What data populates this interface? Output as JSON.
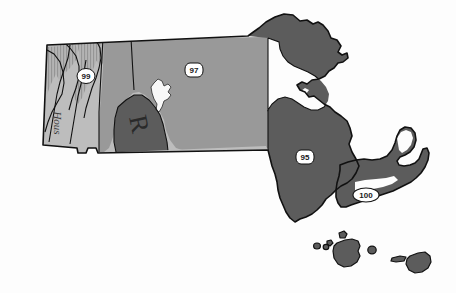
{
  "map": {
    "title": "Massachusetts zone map",
    "subject": "Massachusetts",
    "background_color": "#fdfdfd",
    "outline_color": "#000000",
    "colors": {
      "light_zone": "#bdbdbd",
      "mid_zone": "#999999",
      "dark_zone": "#5c5c5c",
      "hatch_zone": "#b0b0b0",
      "water_white": "#f7f7f7",
      "outline": "#111111",
      "label_badge_fill": "#ffffff",
      "label_text": "#1a1a1a"
    },
    "zone_labels": [
      {
        "id": "zone-99",
        "value": "99",
        "shape": "oval",
        "cx": 86,
        "cy": 76,
        "rx": 9,
        "ry": 7
      },
      {
        "id": "zone-97",
        "value": "97",
        "shape": "rounded",
        "cx": 194,
        "cy": 70,
        "rx": 9,
        "ry": 7
      },
      {
        "id": "zone-95",
        "value": "95",
        "shape": "rounded",
        "cx": 305,
        "cy": 157,
        "rx": 9,
        "ry": 7
      },
      {
        "id": "zone-100",
        "value": "100",
        "shape": "wide-oval",
        "cx": 366,
        "cy": 195,
        "rx": 13,
        "ry": 7
      }
    ],
    "place_labels": [
      {
        "id": "river-housatonic",
        "value": "Hous",
        "orientation": "vertical",
        "x": 58,
        "y": 123
      },
      {
        "id": "region-letter-r",
        "value": "R",
        "orientation": "rotated",
        "x": 139,
        "y": 124
      }
    ],
    "features": {
      "reservoir": "Quabbin Reservoir",
      "cape": "Cape Cod",
      "islands": [
        "Martha's Vineyard",
        "Nantucket",
        "Elizabeth Islands"
      ]
    }
  }
}
